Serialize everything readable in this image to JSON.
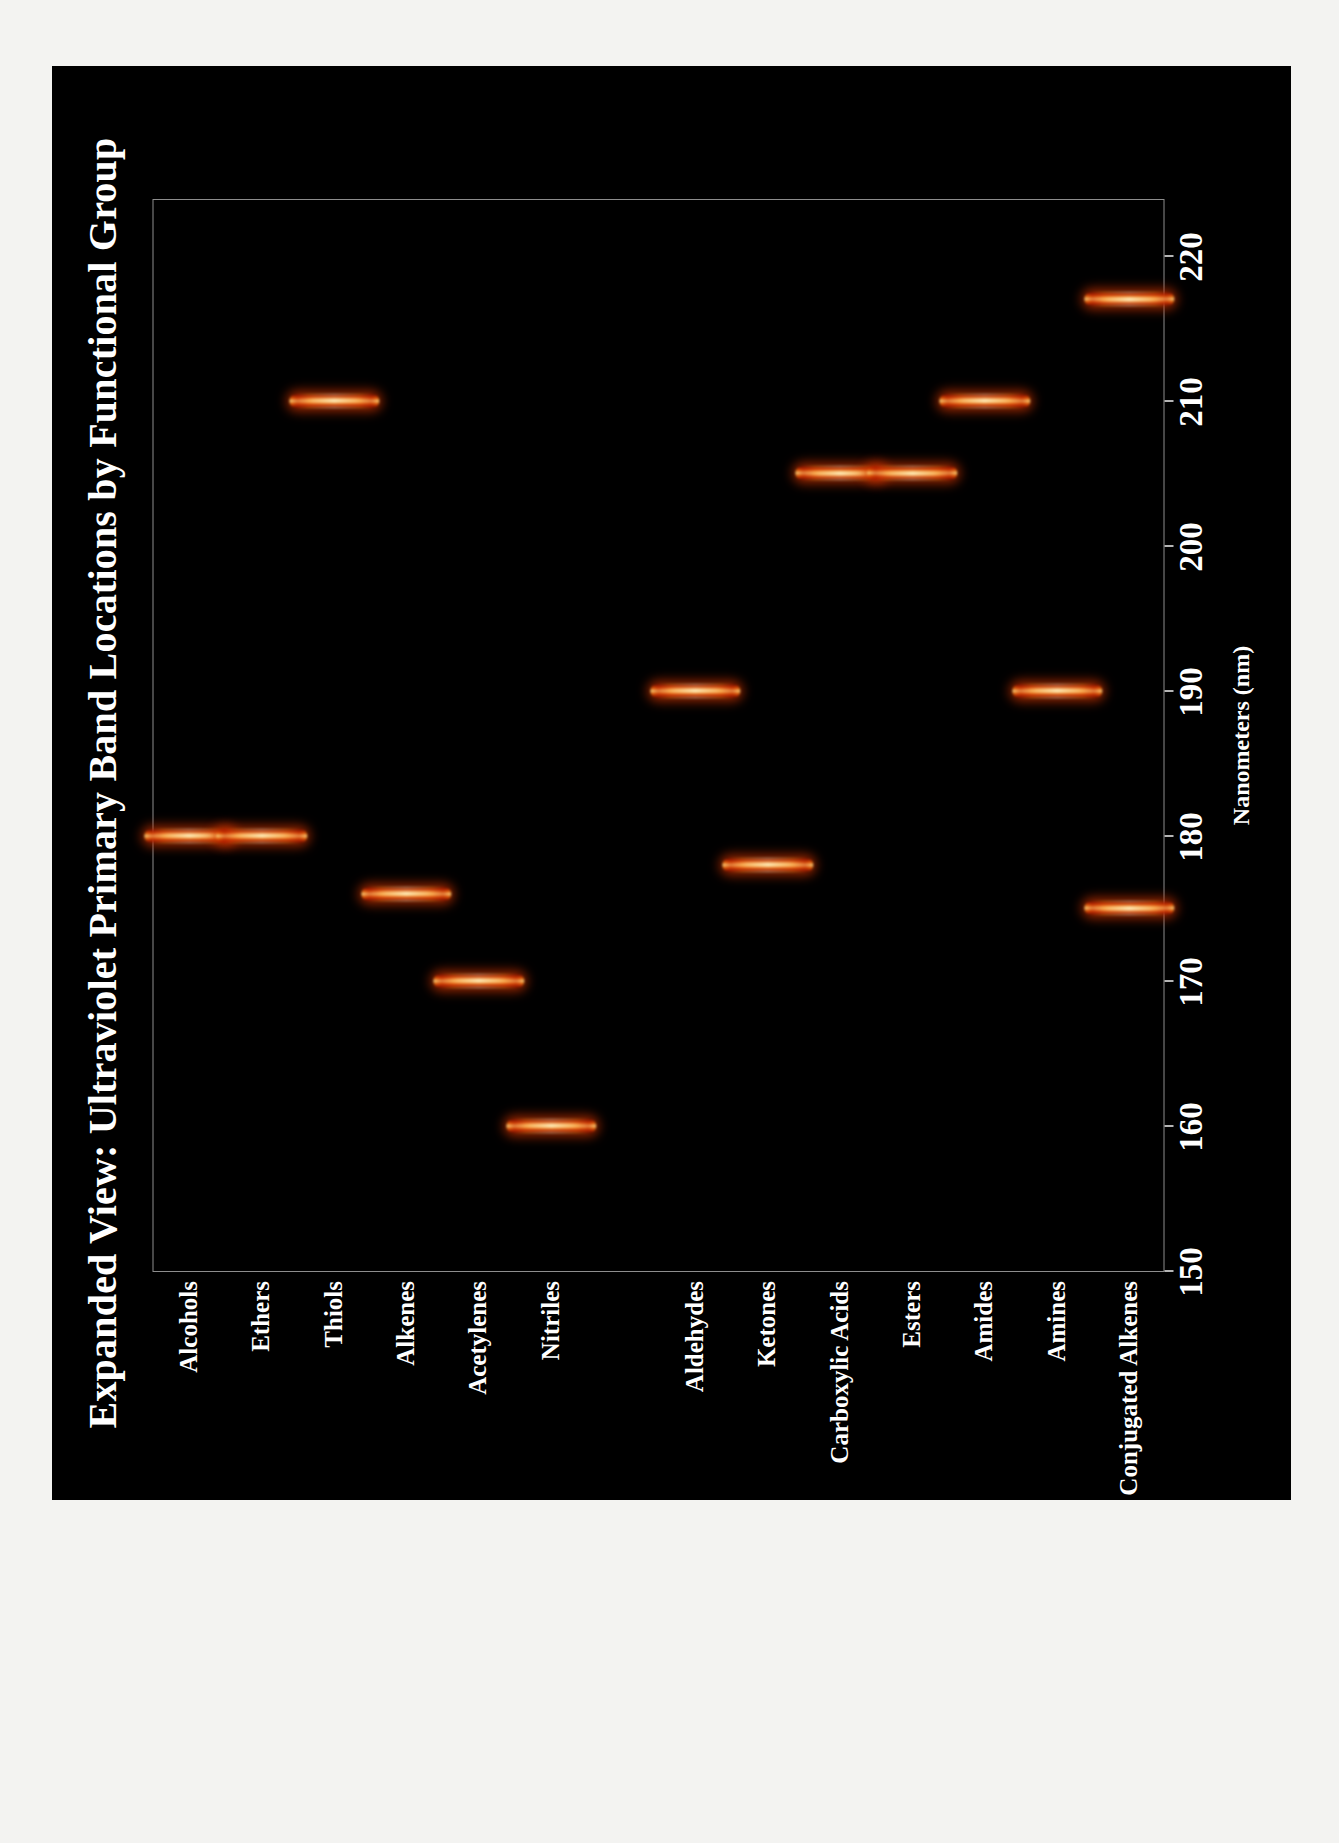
{
  "figure": {
    "title": "Expanded View: Ultraviolet Primary Band Locations by Functional Group",
    "background_color": "#000000",
    "page_color": "#f3f3f1",
    "text_color": "#ffffff"
  },
  "chart_data": {
    "type": "scatter",
    "title": "Expanded View: Ultraviolet Primary Band Locations by Functional Group",
    "xlabel": "Nanometers (nm)",
    "ylabel": "",
    "xlim": [
      150,
      224
    ],
    "xticks": [
      150,
      160,
      170,
      180,
      190,
      200,
      210,
      220
    ],
    "xtick_labels": [
      "150",
      "160",
      "170",
      "180",
      "190",
      "200",
      "210",
      "220"
    ],
    "grid": "dashed vertical gridlines at each labeled tick from 160 to 220",
    "legend": "none",
    "marker_style": "glowing vertical band (heat/flame colormap)",
    "categories": [
      "Alcohols",
      "Ethers",
      "Thiols",
      "Alkenes",
      "Acetylenes",
      "Nitriles",
      "",
      "Aldehydes",
      "Ketones",
      "Carboxylic Acids",
      "Esters",
      "Amides",
      "Amines",
      "Conjugated Alkenes"
    ],
    "points": [
      {
        "category": "Alcohols",
        "value": 180
      },
      {
        "category": "Ethers",
        "value": 180
      },
      {
        "category": "Thiols",
        "value": 210
      },
      {
        "category": "Alkenes",
        "value": 176
      },
      {
        "category": "Acetylenes",
        "value": 170
      },
      {
        "category": "Nitriles",
        "value": 160
      },
      {
        "category": "Aldehydes",
        "value": 190
      },
      {
        "category": "Ketones",
        "value": 178
      },
      {
        "category": "Carboxylic Acids",
        "value": 205
      },
      {
        "category": "Esters",
        "value": 205
      },
      {
        "category": "Amides",
        "value": 210
      },
      {
        "category": "Amines",
        "value": 190
      },
      {
        "category": "Conjugated Alkenes",
        "value": 217
      },
      {
        "category": "Conjugated Alkenes",
        "value": 175
      }
    ]
  }
}
